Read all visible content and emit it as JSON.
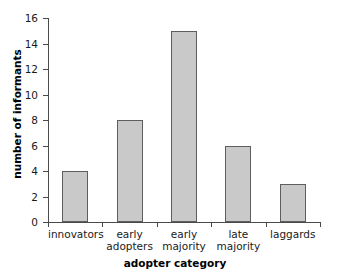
{
  "chart_data": {
    "type": "bar",
    "title": "",
    "xlabel": "adopter category",
    "ylabel": "number of informants",
    "categories": [
      "innovators",
      "early adopters",
      "early majority",
      "late majority",
      "laggards"
    ],
    "values": [
      4,
      8,
      15,
      6,
      3
    ],
    "ylim": [
      0,
      16
    ],
    "ytick_values": [
      0,
      2,
      4,
      6,
      8,
      10,
      12,
      14,
      16
    ],
    "ytick_labels": [
      "0",
      "2",
      "4",
      "6",
      "8",
      "10",
      "12",
      "14",
      "16"
    ],
    "grid": false,
    "legend": false,
    "bar_fill_color": "#c9c9c9",
    "bar_edge_color": "#5e5e5e",
    "axis_color": "#4a4a4a",
    "background_color": "#ffffff"
  }
}
